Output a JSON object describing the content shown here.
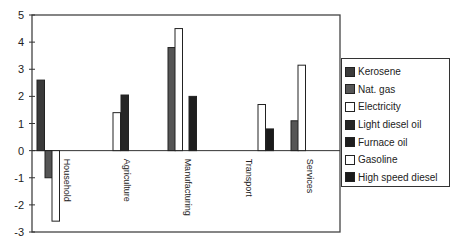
{
  "chart_data": {
    "type": "bar",
    "title": "",
    "xlabel": "",
    "ylabel": "",
    "ylim": [
      -3,
      5
    ],
    "yticks": [
      -3,
      -2,
      -1,
      0,
      1,
      2,
      3,
      4,
      5
    ],
    "grid": false,
    "legend_position": "right",
    "categories": [
      "Household",
      "Agriculture",
      "Manufacturing",
      "Transport",
      "Services"
    ],
    "series": [
      {
        "name": "Kerosene",
        "color": "#3a3a3a",
        "values": [
          2.6,
          null,
          null,
          null,
          null
        ]
      },
      {
        "name": "Nat. gas",
        "color": "#555555",
        "values": [
          -1.0,
          null,
          3.8,
          null,
          1.1
        ]
      },
      {
        "name": "Electricity",
        "color": "#ffffff",
        "values": [
          -2.6,
          1.4,
          4.5,
          null,
          3.15
        ]
      },
      {
        "name": "Light diesel oil",
        "color": "#262626",
        "values": [
          null,
          2.05,
          null,
          null,
          null
        ]
      },
      {
        "name": "Furnace oil",
        "color": "#1e1e1e",
        "values": [
          null,
          null,
          2.0,
          null,
          null
        ]
      },
      {
        "name": "Gasoline",
        "color": "#ffffff",
        "values": [
          null,
          null,
          null,
          1.7,
          null
        ]
      },
      {
        "name": "High speed diesel",
        "color": "#1a1a1a",
        "values": [
          null,
          null,
          null,
          0.8,
          null
        ]
      }
    ]
  }
}
